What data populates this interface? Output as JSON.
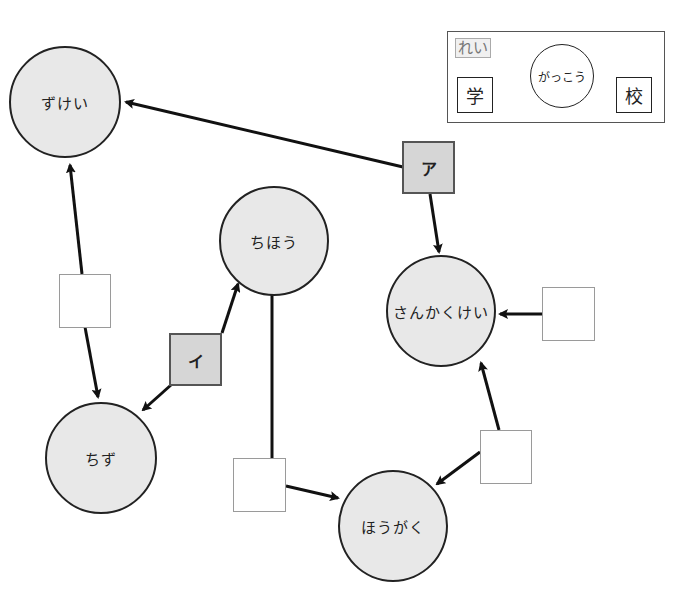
{
  "example": {
    "tag": "れい",
    "kanji_left": "学",
    "kanji_right": "校",
    "reading": "がっこう"
  },
  "nodes": {
    "zukei": "ずけい",
    "chihou": "ちほう",
    "sankakukei": "さんかくけい",
    "chizu": "ちず",
    "hougaku": "ほうがく"
  },
  "labeled_boxes": {
    "a": "ア",
    "i": "イ"
  },
  "answer_boxes": [
    {
      "id": "box-between-zukei-chizu",
      "value": ""
    },
    {
      "id": "box-right-of-sankakukei",
      "value": ""
    },
    {
      "id": "box-below-chihou",
      "value": ""
    },
    {
      "id": "box-between-hougaku-sankakukei",
      "value": ""
    }
  ],
  "colors": {
    "node_fill": "#e8e8e8",
    "label_box_fill": "#d6d6d6",
    "stroke": "#222222"
  }
}
